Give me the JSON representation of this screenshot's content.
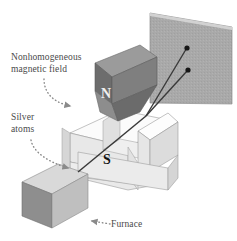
{
  "figure": {
    "labels": {
      "magnetic_field": "Nonhomogeneous\nmagnetic field",
      "silver_atoms": "Silver\natoms",
      "furnace": "Furnace"
    },
    "poles": {
      "north": "N",
      "south": "S"
    },
    "colors": {
      "background": "#ffffff",
      "label_text": "#4a4a4a",
      "north_magnet_top": "#9a9a9a",
      "north_magnet_front": "#6e6e6e",
      "north_magnet_side": "#828282",
      "north_wedge": "#8a8a8a",
      "south_magnet_top": "#fcfcfc",
      "south_magnet_front": "#dcdcdc",
      "south_magnet_side": "#ebebeb",
      "screen_face": "#aaaaaa",
      "screen_edge": "#cccccc",
      "furnace_top": "#d8d8d8",
      "furnace_left": "#8c8c8c",
      "furnace_right": "#bcbcbc",
      "beam_line": "#3a3a3a",
      "beam_dot": "#1a1a1a",
      "dotted_arrow": "#8a8a8a"
    },
    "elements": {
      "detector_screen": "detector-screen",
      "north_magnet": "north-magnet",
      "south_magnet": "south-magnet",
      "furnace_box": "furnace-box",
      "beam_source": "beam-source",
      "beam_upper": "beam-path-upper",
      "beam_lower": "beam-path-lower",
      "deposit_upper": "silver-deposit-upper",
      "deposit_lower": "silver-deposit-lower"
    },
    "beam": {
      "origin_x": 78,
      "origin_y": 172,
      "split_x": 146,
      "split_y": 116,
      "upper_dot_x": 187,
      "upper_dot_y": 48,
      "lower_dot_x": 188,
      "lower_dot_y": 70
    }
  }
}
